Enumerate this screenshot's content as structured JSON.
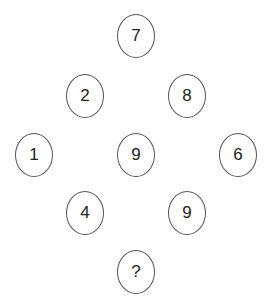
{
  "puzzle": {
    "nodes": [
      {
        "label": "7",
        "x": 136,
        "y": 36
      },
      {
        "label": "2",
        "x": 85,
        "y": 96
      },
      {
        "label": "8",
        "x": 187,
        "y": 96
      },
      {
        "label": "1",
        "x": 34,
        "y": 155
      },
      {
        "label": "9",
        "x": 136,
        "y": 155
      },
      {
        "label": "6",
        "x": 238,
        "y": 155
      },
      {
        "label": "4",
        "x": 85,
        "y": 213
      },
      {
        "label": "9",
        "x": 187,
        "y": 213
      },
      {
        "label": "?",
        "x": 136,
        "y": 272
      }
    ],
    "border_color": "#555555",
    "text_color": "#222222"
  }
}
